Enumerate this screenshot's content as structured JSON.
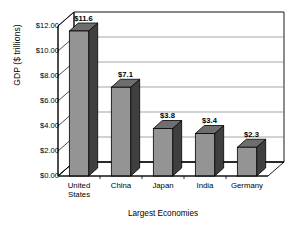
{
  "chart_data": {
    "type": "bar",
    "title": "",
    "subtitle": "",
    "xlabel": "Largest Economies",
    "ylabel": "GDP ($ trillions)",
    "categories": [
      "United States",
      "China",
      "Japan",
      "India",
      "Germany"
    ],
    "category_lines": [
      [
        "United",
        "States"
      ],
      [
        "China"
      ],
      [
        "Japan"
      ],
      [
        "India"
      ],
      [
        "Germany"
      ]
    ],
    "values": [
      11.6,
      7.1,
      3.8,
      3.4,
      2.3
    ],
    "data_labels": [
      "$11.6",
      "$7.1",
      "$3.8",
      "$3.4",
      "$2.3"
    ],
    "ylim": [
      0,
      12
    ],
    "ytick_values": [
      0,
      2,
      4,
      6,
      8,
      10,
      12
    ],
    "ytick_labels": [
      "$0.00",
      "$2.00",
      "$4.00",
      "$6.00",
      "$8.00",
      "$10.00",
      "$12.00"
    ],
    "grid": true,
    "grid_axis": "y",
    "legend": false,
    "legend_position": "none",
    "style": "3d-column",
    "colors": {
      "bar_front": "#949494",
      "bar_side": "#3f3f3f",
      "bar_top": "#6e6e6e",
      "bar_outline": "#000000",
      "plot_background": "#ffffff",
      "grid_line": "#808080",
      "axis_line": "#000000",
      "text": "#000000"
    }
  }
}
